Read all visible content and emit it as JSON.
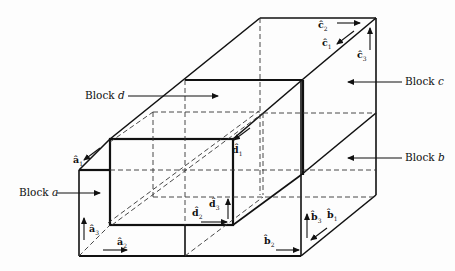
{
  "figure": {
    "type": "3D block decomposition diagram",
    "blocks": [
      {
        "id": "a",
        "label": "Block",
        "letter": "a",
        "unit_vectors": [
          "â1",
          "â2",
          "â3"
        ]
      },
      {
        "id": "b",
        "label": "Block",
        "letter": "b",
        "unit_vectors": [
          "b̂1",
          "b̂2",
          "b̂3"
        ]
      },
      {
        "id": "c",
        "label": "Block",
        "letter": "c",
        "unit_vectors": [
          "ĉ1",
          "ĉ2",
          "ĉ3"
        ]
      },
      {
        "id": "d",
        "label": "Block",
        "letter": "d",
        "unit_vectors": [
          "d̂1",
          "d̂2",
          "d̂3"
        ]
      }
    ]
  },
  "labels": {
    "block_a": {
      "word": "Block",
      "letter": "a"
    },
    "block_b": {
      "word": "Block",
      "letter": "b"
    },
    "block_c": {
      "word": "Block",
      "letter": "c"
    },
    "block_d": {
      "word": "Block",
      "letter": "d"
    }
  },
  "vectors": {
    "a1": {
      "base": "â",
      "sub": "1"
    },
    "a2": {
      "base": "â",
      "sub": "2"
    },
    "a3": {
      "base": "â",
      "sub": "3"
    },
    "b1": {
      "base": "b̂",
      "sub": "1"
    },
    "b2": {
      "base": "b̂",
      "sub": "2"
    },
    "b3": {
      "base": "b̂",
      "sub": "3"
    },
    "c1": {
      "base": "ĉ",
      "sub": "1"
    },
    "c2": {
      "base": "ĉ",
      "sub": "2"
    },
    "c3": {
      "base": "ĉ",
      "sub": "3"
    },
    "d1": {
      "base": "d̂",
      "sub": "1"
    },
    "d2": {
      "base": "d̂",
      "sub": "2"
    },
    "d3": {
      "base": "d̂",
      "sub": "3"
    }
  }
}
